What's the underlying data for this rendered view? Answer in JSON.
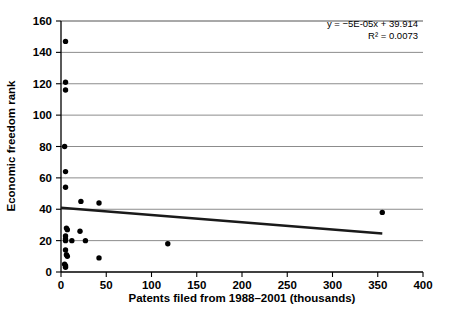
{
  "chart_data": {
    "type": "scatter",
    "title": "",
    "xlabel": "Patents filed from 1988–2001 (thousands)",
    "ylabel": "Economic freedom rank",
    "xlim": [
      0,
      400
    ],
    "ylim": [
      0,
      160
    ],
    "xticks": [
      0,
      50,
      100,
      150,
      200,
      250,
      300,
      350,
      400
    ],
    "yticks": [
      0,
      20,
      40,
      60,
      80,
      100,
      120,
      140,
      160
    ],
    "grid": "horizontal",
    "legend": "none",
    "marker": {
      "shape": "circle",
      "color": "#000000",
      "size": 5
    },
    "annotations": [
      "y = −5E-05x + 39.914",
      "R² = 0.0073"
    ],
    "trendline": {
      "type": "linear",
      "slope": -5e-05,
      "intercept": 39.914,
      "equation": "y = −5E-05x + 39.914",
      "r_squared": 0.0073,
      "x_start": 0,
      "x_end": 355,
      "y_start": 41.0,
      "y_end": 24.5,
      "color": "#1a1a1a"
    },
    "points": [
      {
        "x": 5,
        "y": 147
      },
      {
        "x": 5,
        "y": 121
      },
      {
        "x": 5,
        "y": 116
      },
      {
        "x": 4,
        "y": 80
      },
      {
        "x": 5,
        "y": 64
      },
      {
        "x": 5,
        "y": 54
      },
      {
        "x": 22,
        "y": 45
      },
      {
        "x": 42,
        "y": 44
      },
      {
        "x": 6,
        "y": 28
      },
      {
        "x": 7,
        "y": 27
      },
      {
        "x": 21,
        "y": 26
      },
      {
        "x": 5,
        "y": 23
      },
      {
        "x": 5,
        "y": 21
      },
      {
        "x": 5,
        "y": 20
      },
      {
        "x": 12,
        "y": 20
      },
      {
        "x": 27,
        "y": 20
      },
      {
        "x": 118,
        "y": 18
      },
      {
        "x": 5,
        "y": 14
      },
      {
        "x": 6,
        "y": 11
      },
      {
        "x": 7,
        "y": 10
      },
      {
        "x": 42,
        "y": 9
      },
      {
        "x": 4,
        "y": 5
      },
      {
        "x": 5,
        "y": 4
      },
      {
        "x": 5,
        "y": 3
      },
      {
        "x": 355,
        "y": 38
      }
    ]
  },
  "caption": {
    "ghost_line": ""
  }
}
